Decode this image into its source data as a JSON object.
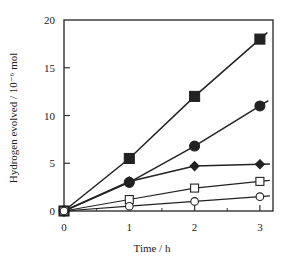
{
  "chart_data": {
    "type": "line",
    "title": "",
    "xlabel": "Time / h",
    "ylabel": "Hydrogen evolved / 10⁻⁶ mol",
    "xlim": [
      0,
      3.2
    ],
    "ylim": [
      0,
      20
    ],
    "x_ticks": [
      0,
      1,
      2,
      3
    ],
    "x_tick_labels": [
      "0",
      "1",
      "2",
      "3"
    ],
    "x_minor_ticks": [
      0.5,
      1.5,
      2.5
    ],
    "y_ticks": [
      0,
      5,
      10,
      15,
      20
    ],
    "y_tick_labels": [
      "0",
      "5",
      "10",
      "15",
      "20"
    ],
    "grid": false,
    "legend": null,
    "x": [
      0,
      1,
      2,
      3
    ],
    "series": [
      {
        "name": "filled-square",
        "marker": "square",
        "filled": true,
        "values": [
          0,
          5.5,
          12.0,
          18.0
        ]
      },
      {
        "name": "filled-circle",
        "marker": "circle",
        "filled": true,
        "values": [
          0,
          3.0,
          6.8,
          11.0
        ]
      },
      {
        "name": "filled-diamond",
        "marker": "diamond",
        "filled": true,
        "values": [
          0,
          3.1,
          4.7,
          4.9
        ]
      },
      {
        "name": "open-square",
        "marker": "square",
        "filled": false,
        "values": [
          0,
          1.2,
          2.4,
          3.1
        ]
      },
      {
        "name": "open-circle",
        "marker": "circle",
        "filled": false,
        "values": [
          0,
          0.5,
          1.0,
          1.5
        ]
      }
    ]
  },
  "colors": {
    "line": "#222222",
    "frame": "#333333",
    "background": "#ffffff"
  }
}
